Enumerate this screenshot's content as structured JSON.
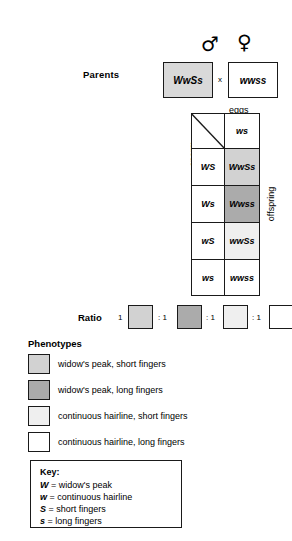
{
  "parents": {
    "label": "Parents",
    "cross_symbol": "x",
    "male_symbol": "♂",
    "female_symbol": "♀",
    "male_genotype": "WwSs",
    "female_genotype": "wwss"
  },
  "punnett": {
    "eggs_label": "eggs",
    "sperm_label": "sperm",
    "offspring_label": "offspring",
    "male_symbol": "♂",
    "female_symbol": "♀",
    "egg_gametes": [
      "ws"
    ],
    "sperm_gametes": [
      "WS",
      "Ws",
      "wS",
      "ws"
    ],
    "offspring": [
      {
        "genotype": "WwSs",
        "shade": "#d2d2d2"
      },
      {
        "genotype": "Wwss",
        "shade": "#ababab"
      },
      {
        "genotype": "wwSs",
        "shade": "#efefef"
      },
      {
        "genotype": "wwss",
        "shade": "#ffffff"
      }
    ]
  },
  "ratio": {
    "label": "Ratio",
    "first_number": "1",
    "separators": [
      ": 1",
      ": 1",
      ": 1"
    ],
    "boxes": [
      "#d2d2d2",
      "#ababab",
      "#efefef",
      "#ffffff"
    ]
  },
  "phenotypes": {
    "heading": "Phenotypes",
    "items": [
      {
        "color": "#d2d2d2",
        "label": "widow's peak, short fingers"
      },
      {
        "color": "#ababab",
        "label": "widow's peak, long fingers"
      },
      {
        "color": "#efefef",
        "label": "continuous hairline, short fingers"
      },
      {
        "color": "#ffffff",
        "label": "continuous hairline, long fingers"
      }
    ]
  },
  "key": {
    "title": "Key:",
    "lines": [
      {
        "allele": "W",
        "equals": "=",
        "meaning": "widow's peak"
      },
      {
        "allele": "w",
        "equals": "=",
        "meaning": "continuous hairline"
      },
      {
        "allele": "S",
        "equals": "=",
        "meaning": "short fingers"
      },
      {
        "allele": "s",
        "equals": "=",
        "meaning": "long fingers"
      }
    ]
  }
}
